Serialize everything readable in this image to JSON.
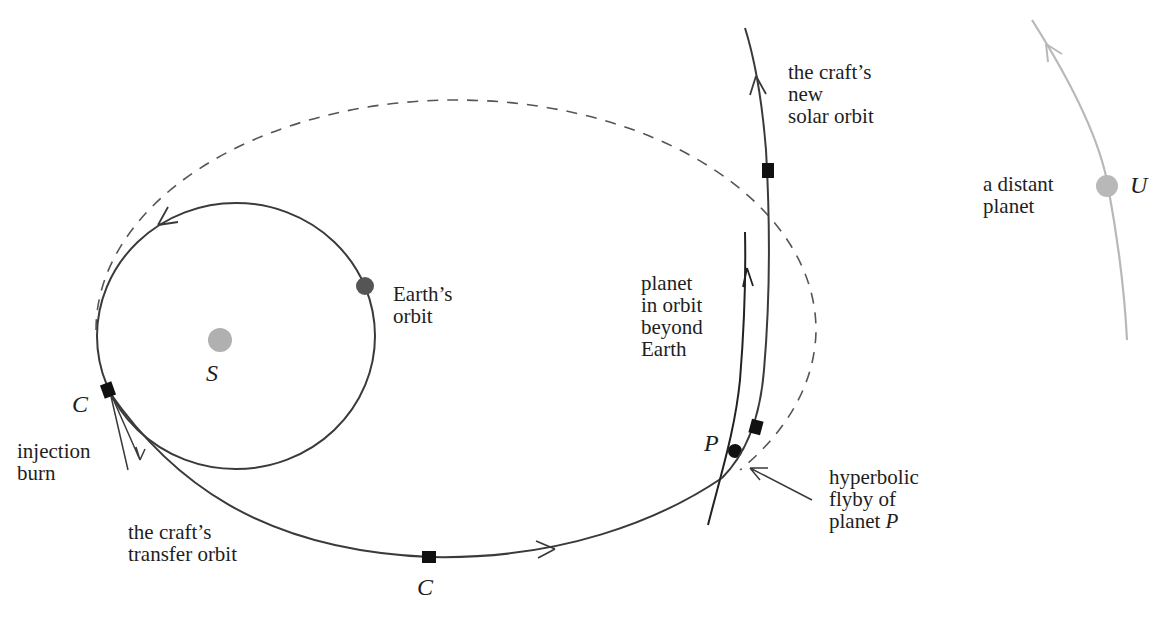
{
  "diagram": {
    "colors": {
      "line": "#3a3a3a",
      "dashed": "#555555",
      "sun": "#b0b0b0",
      "earth": "#555555",
      "distant_planet": "#b8b8b8",
      "craft": "#111111"
    },
    "labels": {
      "sun": "S",
      "earth_orbit": "Earth’s\norbit",
      "craft_start": "C",
      "injection": "injection\nburn",
      "transfer": "the craft’s\ntransfer orbit",
      "craft_mid": "C",
      "planet_orbit": "planet\nin orbit\nbeyond\nEarth",
      "planet": "P",
      "flyby_prefix": "hyperbolic\nflyby of\nplanet ",
      "flyby_planet": "P",
      "new_orbit": "the craft’s\nnew\nsolar orbit",
      "distant": "a distant\nplanet",
      "distant_symbol": "U"
    }
  }
}
